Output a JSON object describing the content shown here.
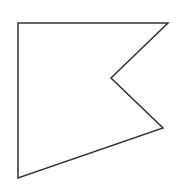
{
  "canvas": {
    "width": 178,
    "height": 196,
    "background": "#ffffff"
  },
  "shape": {
    "type": "polygon",
    "description": "concave pentagon (flag / swallowtail shape)",
    "stroke": "#333333",
    "stroke_width": 1.5,
    "fill": "none",
    "vertices": [
      {
        "x": 18,
        "y": 23
      },
      {
        "x": 168,
        "y": 23
      },
      {
        "x": 111,
        "y": 78
      },
      {
        "x": 163,
        "y": 128
      },
      {
        "x": 18,
        "y": 178
      }
    ]
  }
}
